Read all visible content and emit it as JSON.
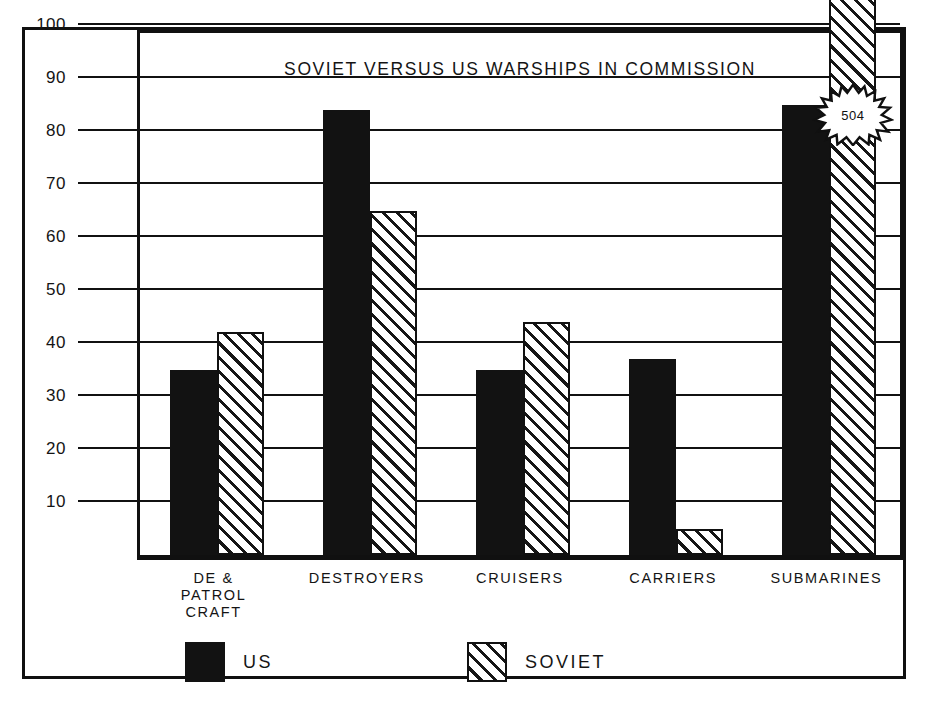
{
  "chart_data": {
    "type": "bar",
    "title": "SOVIET VERSUS US WARSHIPS IN COMMISSION",
    "xlabel": "",
    "ylabel": "",
    "ylim": [
      0,
      100
    ],
    "yticks": [
      10,
      20,
      30,
      40,
      50,
      60,
      70,
      80,
      90,
      100
    ],
    "grid": true,
    "legend_position": "bottom-left",
    "categories": [
      "DE &\nPATROL\nCRAFT",
      "DESTROYERS",
      "CRUISERS",
      "CARRIERS",
      "SUBMARINES"
    ],
    "series": [
      {
        "name": "US",
        "style": "solid-black",
        "values": [
          35,
          84,
          35,
          37,
          85
        ]
      },
      {
        "name": "SOVIET",
        "style": "diagonal-hatch",
        "values": [
          42,
          65,
          44,
          5,
          504
        ]
      }
    ],
    "annotations": [
      {
        "text": "504",
        "shape": "starburst",
        "target_series": "SOVIET",
        "target_category": "SUBMARINES",
        "note": "Soviet submarine bar runs off the top of the chart scale"
      }
    ]
  },
  "chart": {
    "title": "SOVIET VERSUS US WARSHIPS IN COMMISSION",
    "ytick_labels": [
      "100",
      "90",
      "80",
      "70",
      "60",
      "50",
      "40",
      "30",
      "20",
      "10"
    ],
    "categories": [
      {
        "lines": [
          "DE &",
          "PATROL",
          "CRAFT"
        ]
      },
      {
        "lines": [
          "DESTROYERS"
        ]
      },
      {
        "lines": [
          "CRUISERS"
        ]
      },
      {
        "lines": [
          "CARRIERS"
        ]
      },
      {
        "lines": [
          "SUBMARINES"
        ]
      }
    ],
    "callout": {
      "value": "504"
    },
    "legend": [
      {
        "label": "US",
        "style": "solid-black"
      },
      {
        "label": "SOVIET",
        "style": "diagonal-hatch"
      }
    ]
  },
  "colors": {
    "ink": "#111111",
    "paper": "#ffffff",
    "us_fill": "#121212",
    "soviet_hatch": "#161616"
  }
}
